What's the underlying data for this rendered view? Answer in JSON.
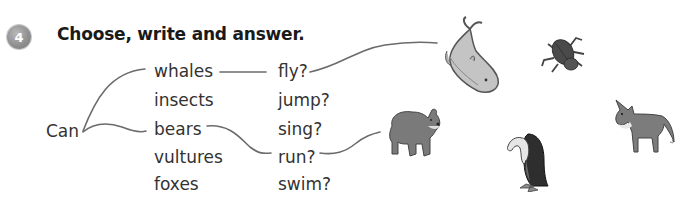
{
  "exercise": {
    "number": "4",
    "title": "Choose, write and answer."
  },
  "sentence_start": "Can",
  "subjects": [
    "whales",
    "insects",
    "bears",
    "vultures",
    "foxes"
  ],
  "verbs": [
    "fly?",
    "jump?",
    "sing?",
    "run?",
    "swim?"
  ],
  "pictures": [
    {
      "name": "whale",
      "icon": "whale-icon"
    },
    {
      "name": "insect",
      "icon": "beetle-icon"
    },
    {
      "name": "bear",
      "icon": "bear-icon"
    },
    {
      "name": "vulture",
      "icon": "vulture-icon"
    },
    {
      "name": "fox",
      "icon": "fox-icon"
    }
  ],
  "colors": {
    "line": "#6b6b6b",
    "badge": "#8d8d8d",
    "text": "#333333"
  }
}
